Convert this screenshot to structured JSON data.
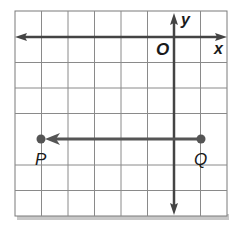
{
  "figure": {
    "type": "coordinate-grid",
    "grid": {
      "cols": 8,
      "rows": 8
    },
    "axes": {
      "x_label": "x",
      "y_label": "y",
      "origin_label": "O"
    },
    "points": [
      {
        "name": "P",
        "label": "P"
      },
      {
        "name": "Q",
        "label": "Q"
      }
    ],
    "ray": {
      "from": "Q",
      "through": "P",
      "direction": "left"
    },
    "colors": {
      "grid": "#8a8a8a",
      "axis": "#444444",
      "ray": "#555555",
      "point": "#555555",
      "shadow": "#bbbbbb"
    }
  }
}
